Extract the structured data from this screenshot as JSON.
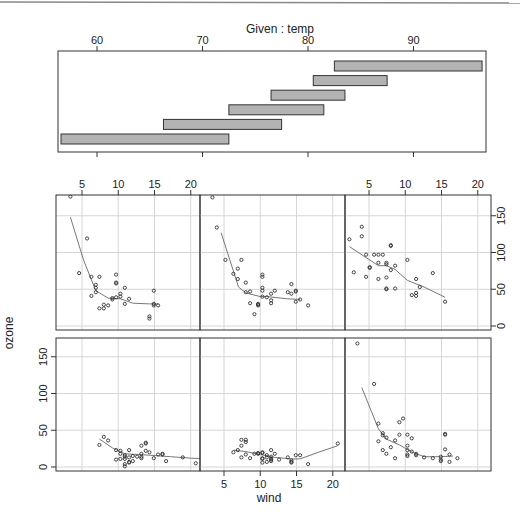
{
  "figure": {
    "given_title": "Given : temp",
    "xlabel": "wind",
    "ylabel": "ozone"
  },
  "chart_data": {
    "type": "scatter",
    "xlabel": "wind",
    "ylabel": "ozone",
    "given": {
      "variable": "temp",
      "label": "Given : temp",
      "ticks": [
        60,
        70,
        80,
        90
      ],
      "range": [
        56.3,
        96.8
      ],
      "intervals": [
        {
          "panel": 1,
          "from": 56.3,
          "to": 72.5
        },
        {
          "panel": 2,
          "from": 66.3,
          "to": 77.5
        },
        {
          "panel": 3,
          "from": 72.5,
          "to": 81.5
        },
        {
          "panel": 4,
          "from": 76.5,
          "to": 83.5
        },
        {
          "panel": 5,
          "from": 80.5,
          "to": 87.5
        },
        {
          "panel": 6,
          "from": 82.5,
          "to": 96.5
        }
      ]
    },
    "xlim": [
      1.6,
      21.8
    ],
    "ylim": [
      -5,
      180
    ],
    "xticks": [
      5,
      10,
      15,
      20
    ],
    "yticks": [
      0,
      50,
      100,
      150
    ],
    "grid": true,
    "layout": {
      "rows": 2,
      "cols": 3,
      "order": "bottom-left first"
    },
    "panels": [
      {
        "panel": 1,
        "temp_range": [
          56.3,
          72.5
        ],
        "points": [
          [
            7.4,
            30
          ],
          [
            8.0,
            41
          ],
          [
            8.6,
            36
          ],
          [
            9.7,
            23
          ],
          [
            10.3,
            22
          ],
          [
            10.3,
            18
          ],
          [
            10.9,
            14
          ],
          [
            10.9,
            16
          ],
          [
            10.9,
            11
          ],
          [
            10.3,
            11
          ],
          [
            11.5,
            7
          ],
          [
            11.5,
            23
          ],
          [
            11.5,
            13
          ],
          [
            12.0,
            8
          ],
          [
            12.0,
            15
          ],
          [
            13.2,
            18
          ],
          [
            13.2,
            14
          ],
          [
            13.2,
            12
          ],
          [
            13.2,
            29
          ],
          [
            13.8,
            33
          ],
          [
            13.8,
            32
          ],
          [
            13.8,
            22
          ],
          [
            14.3,
            20
          ],
          [
            14.9,
            12
          ],
          [
            15.5,
            17
          ],
          [
            16.1,
            18
          ],
          [
            16.1,
            17
          ],
          [
            16.6,
            8
          ],
          [
            18.9,
            13
          ],
          [
            20.7,
            5
          ],
          [
            22.4,
            6
          ],
          [
            23.0,
            36
          ],
          [
            10.9,
            1
          ],
          [
            10.9,
            4
          ],
          [
            11.5,
            6
          ],
          [
            9.7,
            10
          ],
          [
            12.6,
            14
          ]
        ],
        "smooth": [
          [
            7.4,
            38
          ],
          [
            9.2,
            26
          ],
          [
            10.9,
            18
          ],
          [
            12.6,
            17
          ],
          [
            14.3,
            16
          ],
          [
            17.2,
            14
          ],
          [
            20.1,
            12
          ],
          [
            23.0,
            11
          ]
        ]
      },
      {
        "panel": 2,
        "temp_range": [
          66.3,
          77.5
        ],
        "points": [
          [
            6.3,
            20
          ],
          [
            6.9,
            23
          ],
          [
            7.4,
            13
          ],
          [
            7.4,
            29
          ],
          [
            7.4,
            37
          ],
          [
            8.0,
            17
          ],
          [
            8.0,
            37
          ],
          [
            8.0,
            34
          ],
          [
            8.6,
            12
          ],
          [
            9.7,
            18
          ],
          [
            9.7,
            19
          ],
          [
            10.3,
            11
          ],
          [
            10.3,
            20
          ],
          [
            10.3,
            6
          ],
          [
            10.3,
            12
          ],
          [
            10.3,
            19
          ],
          [
            10.9,
            13
          ],
          [
            10.9,
            16
          ],
          [
            10.9,
            7
          ],
          [
            11.5,
            8
          ],
          [
            11.5,
            10
          ],
          [
            11.5,
            14
          ],
          [
            11.5,
            23
          ],
          [
            12.0,
            18
          ],
          [
            12.6,
            10
          ],
          [
            13.8,
            13
          ],
          [
            14.3,
            9
          ],
          [
            14.3,
            6
          ],
          [
            14.3,
            7
          ],
          [
            14.9,
            16
          ],
          [
            15.5,
            16
          ],
          [
            16.6,
            4
          ],
          [
            20.7,
            32
          ],
          [
            9.2,
            18
          ],
          [
            11.5,
            11
          ]
        ],
        "smooth": [
          [
            6.3,
            23
          ],
          [
            8.0,
            21
          ],
          [
            10.0,
            17
          ],
          [
            12.0,
            13
          ],
          [
            14.3,
            11
          ],
          [
            15.5,
            11
          ],
          [
            18.0,
            20
          ],
          [
            20.7,
            29
          ]
        ]
      },
      {
        "panel": 3,
        "temp_range": [
          72.5,
          81.5
        ],
        "points": [
          [
            3.4,
            168
          ],
          [
            5.7,
            113
          ],
          [
            6.3,
            59
          ],
          [
            6.9,
            43
          ],
          [
            6.9,
            46
          ],
          [
            6.3,
            35
          ],
          [
            6.9,
            23
          ],
          [
            7.4,
            40
          ],
          [
            7.4,
            18
          ],
          [
            8.0,
            27
          ],
          [
            8.6,
            12
          ],
          [
            8.6,
            36
          ],
          [
            9.2,
            61
          ],
          [
            9.7,
            66
          ],
          [
            9.2,
            44
          ],
          [
            10.3,
            44
          ],
          [
            10.3,
            29
          ],
          [
            10.3,
            17
          ],
          [
            10.3,
            23
          ],
          [
            10.3,
            15
          ],
          [
            10.9,
            39
          ],
          [
            10.9,
            21
          ],
          [
            11.5,
            16
          ],
          [
            11.5,
            18
          ],
          [
            12.6,
            13
          ],
          [
            13.8,
            12
          ],
          [
            14.9,
            10
          ],
          [
            14.9,
            8
          ],
          [
            14.9,
            14
          ],
          [
            15.5,
            24
          ],
          [
            15.5,
            45
          ],
          [
            15.5,
            44
          ],
          [
            16.1,
            17
          ],
          [
            16.1,
            7
          ],
          [
            17.2,
            12
          ]
        ],
        "smooth": [
          [
            4.0,
            108
          ],
          [
            6.3,
            52
          ],
          [
            7.4,
            38
          ],
          [
            9.2,
            30
          ],
          [
            11.0,
            20
          ],
          [
            12.6,
            14
          ],
          [
            14.9,
            14
          ],
          [
            16.6,
            15
          ]
        ]
      },
      {
        "panel": 4,
        "temp_range": [
          76.5,
          83.5
        ],
        "points": [
          [
            3.4,
            176
          ],
          [
            5.7,
            119
          ],
          [
            4.6,
            72
          ],
          [
            6.3,
            67
          ],
          [
            6.9,
            52
          ],
          [
            6.9,
            56
          ],
          [
            6.9,
            46
          ],
          [
            6.3,
            41
          ],
          [
            7.4,
            67
          ],
          [
            7.4,
            24
          ],
          [
            8.0,
            29
          ],
          [
            8.0,
            24
          ],
          [
            8.6,
            28
          ],
          [
            9.2,
            38
          ],
          [
            9.2,
            36
          ],
          [
            9.7,
            39
          ],
          [
            9.7,
            70
          ],
          [
            9.7,
            59
          ],
          [
            9.7,
            58
          ],
          [
            10.3,
            44
          ],
          [
            10.3,
            40
          ],
          [
            10.9,
            30
          ],
          [
            10.9,
            52
          ],
          [
            11.5,
            37
          ],
          [
            14.3,
            13
          ],
          [
            14.3,
            10
          ],
          [
            14.9,
            48
          ],
          [
            14.9,
            30
          ],
          [
            14.9,
            28
          ],
          [
            15.5,
            28
          ]
        ],
        "smooth": [
          [
            3.4,
            148
          ],
          [
            5.2,
            90
          ],
          [
            6.9,
            48
          ],
          [
            8.6,
            38
          ],
          [
            10.3,
            37
          ],
          [
            12.0,
            31
          ],
          [
            14.3,
            30
          ],
          [
            15.5,
            30
          ]
        ]
      },
      {
        "panel": 5,
        "temp_range": [
          80.5,
          87.5
        ],
        "points": [
          [
            3.4,
            175
          ],
          [
            4.0,
            134
          ],
          [
            5.2,
            90
          ],
          [
            6.3,
            71
          ],
          [
            6.9,
            64
          ],
          [
            6.9,
            78
          ],
          [
            7.4,
            90
          ],
          [
            8.0,
            59
          ],
          [
            8.0,
            46
          ],
          [
            8.6,
            47
          ],
          [
            8.6,
            31
          ],
          [
            9.7,
            29
          ],
          [
            9.7,
            28
          ],
          [
            9.7,
            30
          ],
          [
            9.2,
            16
          ],
          [
            10.3,
            40
          ],
          [
            10.3,
            48
          ],
          [
            10.3,
            67
          ],
          [
            10.3,
            70
          ],
          [
            10.3,
            52
          ],
          [
            10.9,
            39
          ],
          [
            11.5,
            31
          ],
          [
            11.5,
            35
          ],
          [
            11.5,
            44
          ],
          [
            12.0,
            48
          ],
          [
            13.8,
            46
          ],
          [
            14.3,
            57
          ],
          [
            14.3,
            44
          ],
          [
            14.9,
            48
          ],
          [
            14.9,
            47
          ],
          [
            14.9,
            33
          ],
          [
            15.5,
            36
          ],
          [
            16.6,
            28
          ]
        ],
        "smooth": [
          [
            4.6,
            127
          ],
          [
            7.0,
            53
          ],
          [
            8.0,
            45
          ],
          [
            10.0,
            40
          ],
          [
            11.0,
            40
          ],
          [
            13.8,
            37
          ],
          [
            15.5,
            36
          ]
        ]
      },
      {
        "panel": 6,
        "temp_range": [
          82.5,
          96.5
        ],
        "points": [
          [
            2.3,
            118
          ],
          [
            2.9,
            73
          ],
          [
            4.0,
            135
          ],
          [
            4.0,
            122
          ],
          [
            4.6,
            97
          ],
          [
            4.6,
            67
          ],
          [
            5.1,
            80
          ],
          [
            5.1,
            79
          ],
          [
            5.7,
            97
          ],
          [
            6.3,
            97
          ],
          [
            6.3,
            86
          ],
          [
            6.3,
            64
          ],
          [
            6.9,
            97
          ],
          [
            7.4,
            86
          ],
          [
            7.4,
            84
          ],
          [
            7.4,
            66
          ],
          [
            7.4,
            51
          ],
          [
            7.4,
            50
          ],
          [
            8.0,
            76
          ],
          [
            8.0,
            110
          ],
          [
            8.0,
            109
          ],
          [
            8.6,
            82
          ],
          [
            8.6,
            51
          ],
          [
            10.3,
            90
          ],
          [
            10.9,
            42
          ],
          [
            11.5,
            64
          ],
          [
            11.5,
            45
          ],
          [
            11.5,
            41
          ],
          [
            12.0,
            53
          ],
          [
            13.8,
            72
          ],
          [
            15.5,
            33
          ]
        ],
        "smooth": [
          [
            2.3,
            108
          ],
          [
            4.6,
            93
          ],
          [
            6.3,
            82
          ],
          [
            7.4,
            82
          ],
          [
            8.6,
            77
          ],
          [
            10.3,
            62
          ],
          [
            12.6,
            53
          ],
          [
            15.5,
            39
          ]
        ]
      }
    ]
  }
}
